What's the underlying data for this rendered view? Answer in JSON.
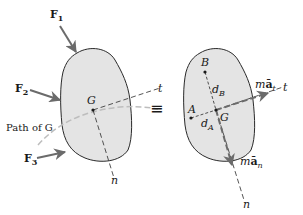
{
  "figure": {
    "left_body": {
      "forces": [
        {
          "name": "F",
          "sub": "1"
        },
        {
          "name": "F",
          "sub": "2"
        },
        {
          "name": "F",
          "sub": "3"
        }
      ],
      "center_label": "G",
      "path_label": "Path of G",
      "t_label": "t",
      "n_label": "n"
    },
    "equivalence_symbol": "≡",
    "right_body": {
      "point_a": "A",
      "point_b": "B",
      "center_label": "G",
      "d_a": {
        "main": "d",
        "sub": "A"
      },
      "d_b": {
        "main": "d",
        "sub": "B"
      },
      "tangential": {
        "m": "m",
        "a": "ā",
        "sub": "t"
      },
      "normal": {
        "m": "m",
        "a": "ā",
        "sub": "n"
      },
      "t_label": "t",
      "n_label": "n"
    },
    "colors": {
      "body_fill": "#e4e4e4",
      "outline": "#2a2a2a",
      "arrow": "#6b6b6b",
      "path": "#bdbdbd"
    }
  }
}
